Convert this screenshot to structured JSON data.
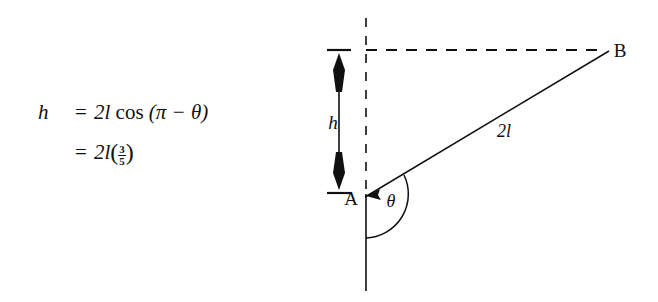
{
  "figure": {
    "background_color": "#ffffff",
    "ink_color": "#101010",
    "equation": {
      "line1": {
        "lhs": "h",
        "relation": "=",
        "rhs_coefficient": "2l",
        "rhs_function": "cos",
        "rhs_argument": "(π − θ)"
      },
      "line2": {
        "lhs": "",
        "relation": "=",
        "rhs_coefficient": "2l",
        "fraction_numerator": "3",
        "fraction_denominator": "5",
        "paren_open": "(",
        "paren_close": ")"
      }
    },
    "diagram": {
      "point_a_label": "A",
      "point_b_label": "B",
      "angle_label": "θ",
      "height_label": "h",
      "segment_label": "2l",
      "vertical_line_style_above_a": "dashed",
      "vertical_line_style_below_a": "solid",
      "horizontal_line_style": "dashed",
      "segment_ab_style": "solid",
      "height_arrow_style": "double-headed",
      "angle_arc_style": "arc-from-segment-to-downward-vertical"
    }
  }
}
